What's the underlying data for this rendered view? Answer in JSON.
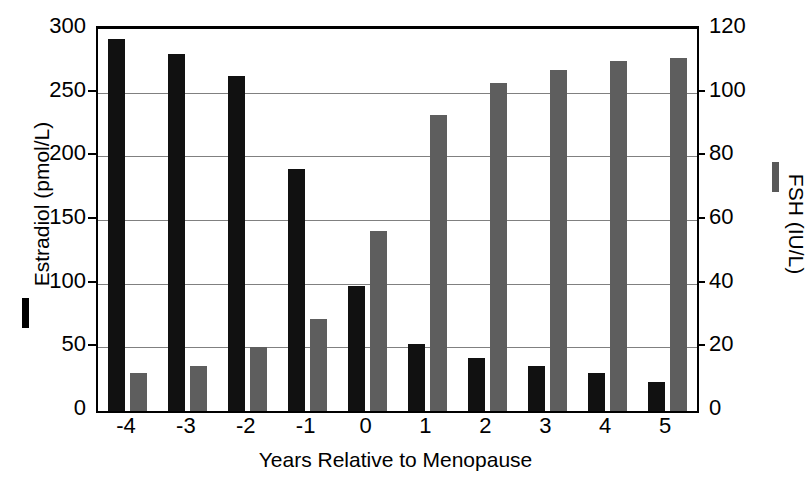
{
  "chart_data": {
    "type": "bar",
    "title": "",
    "xlabel": "Years Relative to Menopause",
    "ylabel": "Estradiol (pmol/L)",
    "y2label": "FSH (IU/L)",
    "categories": [
      "-4",
      "-3",
      "-2",
      "-1",
      "0",
      "1",
      "2",
      "3",
      "4",
      "5"
    ],
    "ylim": [
      0,
      300
    ],
    "y2lim": [
      0,
      120
    ],
    "yticks": [
      "0",
      "50",
      "100",
      "150",
      "200",
      "250",
      "300"
    ],
    "ytick_values": [
      0,
      50,
      100,
      150,
      200,
      250,
      300
    ],
    "y2ticks": [
      "0",
      "20",
      "40",
      "60",
      "80",
      "100",
      "120"
    ],
    "y2tick_values": [
      0,
      20,
      40,
      60,
      80,
      100,
      120
    ],
    "grid": true,
    "legend_position": "outside-left-and-right-axis-titles",
    "series": [
      {
        "name": "Estradiol (pmol/L)",
        "axis": "left",
        "color": "#111111",
        "values": [
          292,
          280,
          263,
          190,
          98,
          53,
          42,
          35,
          30,
          23
        ]
      },
      {
        "name": "FSH (IU/L)",
        "axis": "right",
        "color": "#5e5e5e",
        "values": [
          12,
          14,
          20,
          29,
          56.5,
          93,
          103,
          107,
          110,
          111
        ]
      }
    ]
  },
  "legend": {
    "estradiol_label": "Estradiol (pmol/L)",
    "fsh_label": "FSH (IU/L)"
  },
  "caption": {
    "text": ""
  }
}
